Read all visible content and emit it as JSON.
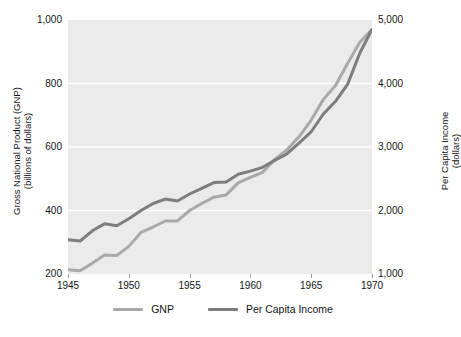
{
  "chart_data": {
    "type": "line",
    "title": "",
    "xlabel": "",
    "ylabel": "Gross National Product (GNP) (billions of dollars)",
    "y2label": "Per Capita Income (dollars)",
    "grid": true,
    "legend_position": "bottom-center",
    "xlim": [
      1945,
      1970
    ],
    "ylim": [
      200,
      1000
    ],
    "y2lim": [
      1000,
      5000
    ],
    "xticks": [
      "1945",
      "1950",
      "1955",
      "1960",
      "1965",
      "1970"
    ],
    "xtick_values": [
      1945,
      1950,
      1955,
      1960,
      1965,
      1970
    ],
    "yticks": [
      "200",
      "400",
      "600",
      "800",
      "1,000"
    ],
    "ytick_values": [
      200,
      400,
      600,
      800,
      1000
    ],
    "y2ticks": [
      "1,000",
      "2,000",
      "3,000",
      "4,000",
      "5,000"
    ],
    "y2tick_values": [
      1000,
      2000,
      3000,
      4000,
      5000
    ],
    "x": [
      1945,
      1946,
      1947,
      1948,
      1949,
      1950,
      1951,
      1952,
      1953,
      1954,
      1955,
      1956,
      1957,
      1958,
      1959,
      1960,
      1961,
      1962,
      1963,
      1964,
      1965,
      1966,
      1967,
      1968,
      1969,
      1970
    ],
    "series": [
      {
        "name": "GNP",
        "axis": "left",
        "color": "#a9a9a9",
        "units": "billions of dollars",
        "values": [
          213,
          210,
          234,
          260,
          258,
          287,
          331,
          348,
          367,
          367,
          400,
          422,
          442,
          449,
          487,
          504,
          520,
          561,
          591,
          632,
          685,
          750,
          794,
          864,
          930,
          970
        ]
      },
      {
        "name": "Per Capita Income",
        "axis": "right",
        "color": "#7d7d7d",
        "units": "dollars",
        "values": [
          1540,
          1520,
          1680,
          1790,
          1760,
          1870,
          2000,
          2110,
          2180,
          2150,
          2260,
          2350,
          2440,
          2450,
          2570,
          2620,
          2680,
          2790,
          2890,
          3060,
          3240,
          3520,
          3720,
          3990,
          4480,
          4850
        ]
      }
    ],
    "legend": [
      {
        "label": "GNP",
        "color": "#a9a9a9"
      },
      {
        "label": "Per Capita Income",
        "color": "#7d7d7d"
      }
    ]
  },
  "style": {
    "plot_background": "#ebebeb",
    "gridline_color": "#ffffff",
    "page_background": "#ffffff",
    "text_color": "#141414"
  },
  "axis_titles": {
    "left_line1": "Gross National Product (GNP)",
    "left_line2": "(billions of dollars)",
    "right_line1": "Per Capita Income",
    "right_line2": "(dollars)"
  }
}
